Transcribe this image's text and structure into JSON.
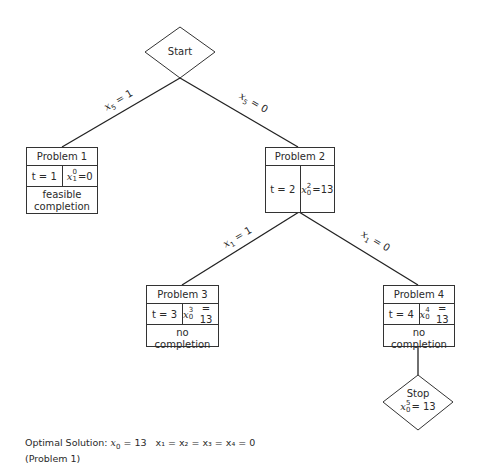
{
  "diagram": {
    "type": "branch-and-bound tree",
    "start": {
      "label": "Start"
    },
    "edges": [
      {
        "from": "start",
        "to": "problem1",
        "label_var": "x",
        "label_sub": "5",
        "label_val": "1"
      },
      {
        "from": "start",
        "to": "problem2",
        "label_var": "x",
        "label_sub": "5",
        "label_val": "0"
      },
      {
        "from": "problem2",
        "to": "problem3",
        "label_var": "x",
        "label_sub": "1",
        "label_val": "1"
      },
      {
        "from": "problem2",
        "to": "problem4",
        "label_var": "x",
        "label_sub": "1",
        "label_val": "0"
      },
      {
        "from": "problem4",
        "to": "stop"
      }
    ],
    "problems": [
      {
        "title": "Problem 1",
        "t": "t = 1",
        "x_sup": "0",
        "x_sub": "1",
        "x_val": "=0",
        "status_line1": "feasible",
        "status_line2": "completion"
      },
      {
        "title": "Problem 2",
        "t": "t = 2",
        "x_sup": "2",
        "x_sub": "0",
        "x_val": "=13",
        "status_line1": "",
        "status_line2": ""
      },
      {
        "title": "Problem 3",
        "t": "t = 3",
        "x_sup": "3",
        "x_sub": "0",
        "x_val": "= 13",
        "status_line1": "no",
        "status_line2": "completion"
      },
      {
        "title": "Problem 4",
        "t": "t = 4",
        "x_sup": "4",
        "x_sub": "0",
        "x_val": "= 13",
        "status_line1": "no",
        "status_line2": "completion"
      }
    ],
    "stop": {
      "label": "Stop",
      "x_sup": "5",
      "x_sub": "0",
      "x_val": "= 13"
    }
  },
  "footer": {
    "prefix": "Optimal Solution:",
    "x0": "x",
    "x0_sub": "0",
    "x0_val": "= 13",
    "rest": "x₁ = x₂ = x₃ = x₄ = 0",
    "line2": "(Problem 1)"
  }
}
